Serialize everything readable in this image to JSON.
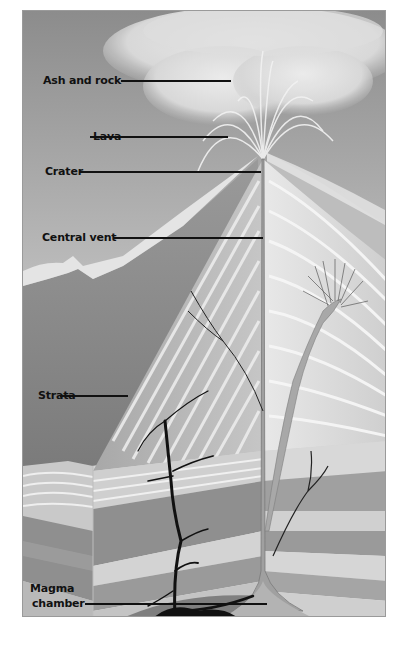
{
  "diagram": {
    "labels": [
      {
        "id": "ash-and-rock",
        "text": "Ash and rock"
      },
      {
        "id": "lava",
        "text": "Lava"
      },
      {
        "id": "crater",
        "text": "Crater"
      },
      {
        "id": "central-vent",
        "text": "Central vent"
      },
      {
        "id": "strata",
        "text": "Strata"
      },
      {
        "id": "magma-chamber-line1",
        "text": "Magma"
      },
      {
        "id": "magma-chamber-line2",
        "text": "chamber"
      }
    ],
    "colors": {
      "sky_top": "#8c8c8c",
      "sky_bottom": "#e6e6e6",
      "mountain_dark": "#7d7d7d",
      "mountain_light": "#d8d8d8",
      "strata_band_dark": "#8f8f8f",
      "strata_band_mid": "#b5b5b5",
      "strata_band_light": "#d3d3d3",
      "dike": "#111111",
      "vent": "#9b9b9b",
      "leader_line": "#111111"
    }
  }
}
